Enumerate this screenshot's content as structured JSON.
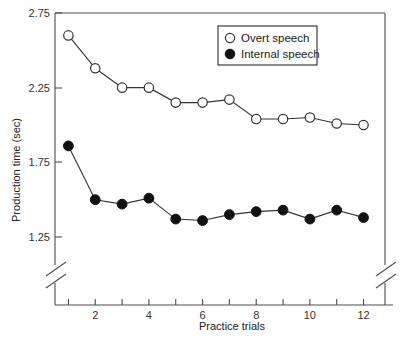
{
  "chart_data": {
    "type": "line",
    "title": "",
    "xlabel": "Practice trials",
    "ylabel": "Production time (sec)",
    "x": [
      1,
      2,
      3,
      4,
      5,
      6,
      7,
      8,
      9,
      10,
      11,
      12
    ],
    "xlim": [
      0.5,
      12.8
    ],
    "ylim": [
      1.12,
      2.75
    ],
    "yticks": [
      1.25,
      1.75,
      2.25,
      2.75
    ],
    "ytick_labels": [
      "1.25",
      "1.75",
      "2.25",
      "2.75"
    ],
    "xticks": [
      1,
      2,
      3,
      4,
      5,
      6,
      7,
      8,
      9,
      10,
      11,
      12
    ],
    "xtick_labels": [
      "",
      "2",
      "",
      "4",
      "",
      "6",
      "",
      "8",
      "",
      "10",
      "",
      "12"
    ],
    "grid": false,
    "axis_break": true,
    "legend_position": "top-right",
    "series": [
      {
        "name": "Overt speech",
        "marker": "open-circle",
        "values": [
          2.6,
          2.38,
          2.25,
          2.25,
          2.15,
          2.15,
          2.17,
          2.04,
          2.04,
          2.05,
          2.01,
          2.0
        ]
      },
      {
        "name": "Internal speech",
        "marker": "filled-circle",
        "values": [
          1.86,
          1.5,
          1.47,
          1.51,
          1.37,
          1.36,
          1.4,
          1.42,
          1.43,
          1.37,
          1.43,
          1.38
        ]
      }
    ]
  },
  "legend": {
    "entries": [
      {
        "label": "Overt speech",
        "marker": "open-circle"
      },
      {
        "label": "Internal speech",
        "marker": "filled-circle"
      }
    ]
  },
  "axes": {
    "y_title": "Production time (sec)",
    "x_title": "Practice trials",
    "y_labels": [
      "2.75",
      "2.25",
      "1.75",
      "1.25"
    ],
    "x_labels": [
      "2",
      "4",
      "6",
      "8",
      "10",
      "12"
    ]
  },
  "colors": {
    "axis": "#4d4d4d",
    "line": "#333333",
    "open_marker_fill": "#ffffff",
    "filled_marker": "#111111",
    "text": "#1a1a1a",
    "background": "#ffffff"
  },
  "caption_fragment": ""
}
